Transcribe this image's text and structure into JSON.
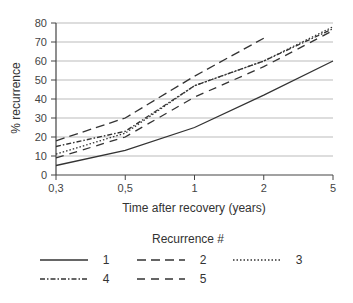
{
  "chart_data": {
    "type": "line",
    "title": "",
    "xlabel": "Time after recovery (years)",
    "ylabel": "% recurrence",
    "categories": [
      "0,3",
      "0,5",
      "1",
      "2",
      "5"
    ],
    "y_ticks": [
      "0",
      "10",
      "20",
      "30",
      "40",
      "50",
      "60",
      "70",
      "80"
    ],
    "ylim": [
      0,
      80
    ],
    "grid": "horizontal",
    "legend_title": "Recurrence #",
    "legend_position": "bottom",
    "series": [
      {
        "name": "1",
        "style": "solid",
        "values": [
          5,
          13,
          25,
          42,
          60
        ]
      },
      {
        "name": "2",
        "style": "long-dash",
        "values": [
          18,
          30,
          52,
          72,
          null
        ]
      },
      {
        "name": "3",
        "style": "dotted",
        "values": [
          11,
          22,
          47,
          60,
          78
        ]
      },
      {
        "name": "4",
        "style": "dash-dot",
        "values": [
          15,
          23,
          47,
          60,
          77
        ]
      },
      {
        "name": "5",
        "style": "dashed",
        "values": [
          9,
          20,
          41,
          57,
          76
        ]
      }
    ]
  }
}
